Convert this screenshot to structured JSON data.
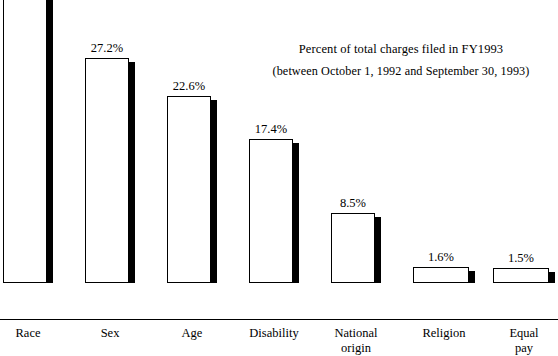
{
  "chart_data": {
    "type": "bar",
    "title": "Percent of total charges filed in FY1993",
    "subtitle": "(between October 1, 1992 and September 30, 1993)",
    "xlabel": "",
    "ylabel": "",
    "ylim": [
      0,
      36.1
    ],
    "grid": false,
    "legend": false,
    "categories": [
      "Race",
      "Sex",
      "Age",
      "Disability",
      "National origin",
      "Religion",
      "Equal pay"
    ],
    "values": [
      36.1,
      27.2,
      22.6,
      17.4,
      8.5,
      1.6,
      1.5
    ],
    "value_labels": [
      "36.1%",
      "27.2%",
      "22.6%",
      "17.4%",
      "8.5%",
      "1.6%",
      "1.5%"
    ],
    "colors": {
      "bar_fill": "#ffffff",
      "bar_outline": "#000000",
      "bar_shadow": "#000000",
      "text": "#000000",
      "background": "#ffffff"
    }
  },
  "chart": {
    "title": {
      "line1": "Percent of total charges filed in FY1993",
      "line2": "(between October 1, 1992 and September 30, 1993)"
    },
    "bars": [
      {
        "category": "Race",
        "label": "Race",
        "value": 36.1,
        "value_label": "36.1%",
        "x": 3,
        "width": 44,
        "side": 6,
        "height": 299
      },
      {
        "category": "Sex",
        "label": "Sex",
        "value": 27.2,
        "value_label": "27.2%",
        "x": 85,
        "width": 44,
        "side": 6,
        "height": 225
      },
      {
        "category": "Age",
        "label": "Age",
        "value": 22.6,
        "value_label": "22.6%",
        "x": 167,
        "width": 44,
        "side": 6,
        "height": 187
      },
      {
        "category": "Disability",
        "label": "Disability",
        "value": 17.4,
        "value_label": "17.4%",
        "x": 249,
        "width": 44,
        "side": 6,
        "height": 144
      },
      {
        "category": "National origin",
        "label": "National\norigin",
        "value": 8.5,
        "value_label": "8.5%",
        "x": 331,
        "width": 44,
        "side": 6,
        "height": 70
      },
      {
        "category": "Religion",
        "label": "Religion",
        "value": 1.6,
        "value_label": "1.6%",
        "x": 413,
        "width": 56,
        "side": 6,
        "height": 16
      },
      {
        "category": "Equal pay",
        "label": "Equal\npay",
        "value": 1.5,
        "value_label": "1.5%",
        "x": 493,
        "width": 56,
        "side": 6,
        "height": 15
      }
    ]
  }
}
